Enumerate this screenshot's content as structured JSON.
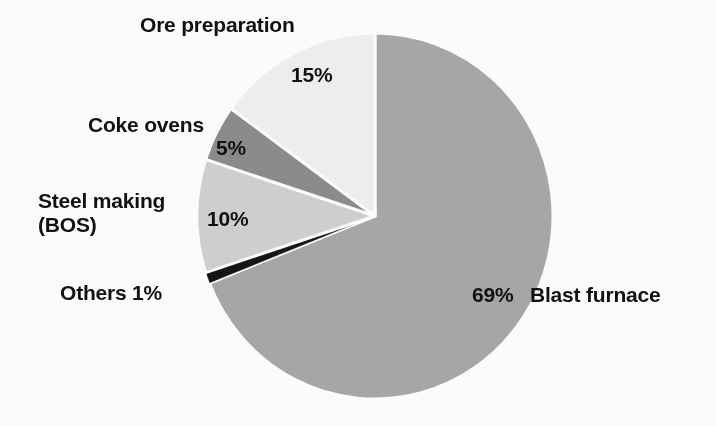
{
  "chart_data": {
    "type": "pie",
    "title": "",
    "subtitle": "",
    "xlabel": "",
    "ylabel": "",
    "legend_position": "none",
    "labels_position": "outside-with-percent-inside",
    "grid": false,
    "units": "%",
    "total": 100,
    "categories": [
      "Blast furnace",
      "Ore preparation",
      "Coke ovens",
      "Steel making (BOS)",
      "Others"
    ],
    "values": [
      69,
      15,
      5,
      10,
      1
    ],
    "value_labels": [
      "69%",
      "15%",
      "5%",
      "10%",
      "1%"
    ],
    "colors": [
      "#a9a9a9",
      "#f1f1f1",
      "#8d8d8d",
      "#d2d2d2",
      "#151515"
    ],
    "slices": [
      {
        "name": "Blast furnace",
        "value": 69,
        "value_label": "69%",
        "color": "#a9a9a9",
        "start_angle_deg": 0,
        "end_angle_deg": 248.4
      },
      {
        "name": "Others",
        "value": 1,
        "value_label": "1%",
        "color": "#151515",
        "start_angle_deg": 248.4,
        "end_angle_deg": 252.0
      },
      {
        "name": "Steel making (BOS)",
        "value": 10,
        "value_label": "10%",
        "color": "#d2d2d2",
        "start_angle_deg": 252.0,
        "end_angle_deg": 288.0
      },
      {
        "name": "Coke ovens",
        "value": 5,
        "value_label": "5%",
        "color": "#8d8d8d",
        "start_angle_deg": 288.0,
        "end_angle_deg": 306.0
      },
      {
        "name": "Ore preparation",
        "value": 15,
        "value_label": "15%",
        "color": "#f1f1f1",
        "start_angle_deg": 306.0,
        "end_angle_deg": 360.0
      }
    ]
  },
  "labels": {
    "ore_preparation": "Ore preparation",
    "coke_ovens": "Coke ovens",
    "steel_making_line1": "Steel making",
    "steel_making_line2": "(BOS)",
    "others": "Others 1%",
    "blast_furnace": "Blast furnace"
  },
  "percents": {
    "ore_preparation": "15%",
    "coke_ovens": "5%",
    "steel_making": "10%",
    "blast_furnace": "69%",
    "others": "1%"
  },
  "style": {
    "background": "#ffffff",
    "text_color": "#111111",
    "separator_color": "#ffffff"
  }
}
